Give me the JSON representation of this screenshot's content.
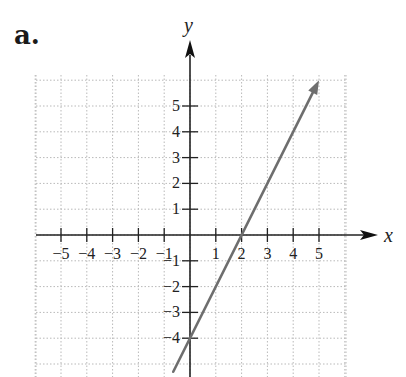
{
  "figure": {
    "part_label": "a."
  },
  "chart_data": {
    "type": "line",
    "title": "",
    "xlabel": "x",
    "ylabel": "y",
    "equation": "y = 2x - 4",
    "x_ticks": [
      -5,
      -4,
      -3,
      -2,
      -1,
      1,
      2,
      3,
      4,
      5
    ],
    "y_ticks": [
      5,
      4,
      3,
      2,
      1,
      -1,
      -2,
      -3,
      -4
    ],
    "x_tick_labels": [
      "−5",
      "−4",
      "−3",
      "−2",
      "−1",
      "1",
      "2",
      "3",
      "4",
      "5"
    ],
    "y_tick_labels": [
      "5",
      "4",
      "3",
      "2",
      "1",
      "−1",
      "−2",
      "−3",
      "−4"
    ],
    "xlim": [
      -5.9,
      6.0
    ],
    "ylim": [
      -5.3,
      6.2
    ],
    "grid": true,
    "grid_style": "dotted",
    "series": [
      {
        "name": "line",
        "x": [
          -0.65,
          0,
          2,
          5
        ],
        "y": [
          -5.3,
          -4,
          0,
          6
        ],
        "arrow_end": true,
        "color": "#6e6e6e"
      }
    ],
    "key_points": [
      {
        "label": "y-intercept",
        "x": 0,
        "y": -4
      },
      {
        "label": "x-intercept",
        "x": 2,
        "y": 0
      }
    ]
  }
}
